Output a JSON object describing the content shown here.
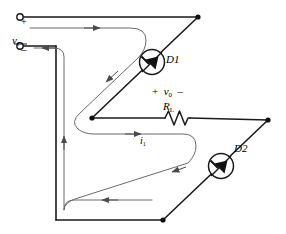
{
  "figure": {
    "kind": "circuit-diagram",
    "background_color": "#ffffff",
    "wire_color": "#1a1a1a",
    "current_path_color": "#555555"
  },
  "labels": {
    "source_voltage": "v",
    "source_voltage_sub": "i",
    "terminal_plus": "+",
    "terminal_minus": "–",
    "diode1": "D1",
    "diode2": "D2",
    "load_resistor": "R",
    "load_resistor_sub": "L",
    "output_polarity_plus": "+",
    "output_voltage": "v",
    "output_voltage_sub": "0",
    "output_polarity_minus": "–",
    "current": "i",
    "current_sub": "1"
  },
  "icons": {
    "diode1": "diode-in-circle-icon",
    "diode2": "diode-in-circle-icon",
    "resistor": "zigzag-resistor-icon",
    "terminal_top": "open-terminal-circle-icon",
    "terminal_bottom": "open-terminal-circle-icon",
    "node_top_right": "junction-dot-icon",
    "node_mid_left": "junction-dot-icon",
    "node_mid_right": "junction-dot-icon",
    "node_bottom": "junction-dot-icon",
    "arrow_top": "current-arrow-right-icon",
    "arrow_upper_diagonal": "current-arrow-down-left-icon",
    "arrow_middle": "current-arrow-right-icon",
    "arrow_lower_diagonal": "current-arrow-down-left-icon",
    "arrow_bottom": "current-arrow-left-icon",
    "arrow_left_vertical": "current-arrow-up-icon",
    "arrow_return": "current-arrow-left-icon"
  }
}
